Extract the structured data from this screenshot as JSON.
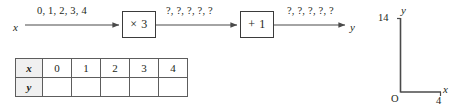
{
  "figure": {
    "ink_color": "#231f20",
    "line_color": "#4a4a4a"
  },
  "flow": {
    "input_label": "x",
    "output_label": "y",
    "edges": [
      {
        "name": "input-values",
        "label": "0, 1, 2, 3, 4"
      },
      {
        "name": "after-multiply",
        "label": "?, ?, ?, ?, ?"
      },
      {
        "name": "after-add",
        "label": "?, ?, ?, ?, ?"
      }
    ],
    "boxes": [
      {
        "name": "multiply-box",
        "label": "× 3"
      },
      {
        "name": "add-box",
        "label": "+ 1"
      }
    ]
  },
  "table": {
    "rows": [
      {
        "header": "x",
        "cells": [
          "0",
          "1",
          "2",
          "3",
          "4"
        ]
      },
      {
        "header": "y",
        "cells": [
          "",
          "",
          "",
          "",
          ""
        ]
      }
    ]
  },
  "axes": {
    "y_axis_label": "y",
    "x_axis_label": "x",
    "origin_label": "O",
    "y_max_tick": "14",
    "x_max_tick": "4"
  }
}
